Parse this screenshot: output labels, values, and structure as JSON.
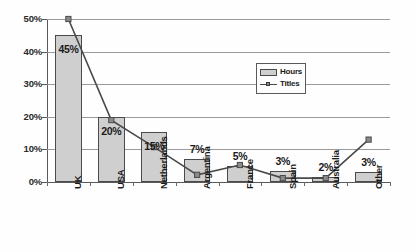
{
  "chart_data": {
    "type": "bar",
    "title": "",
    "subtitle": "",
    "xlabel": "",
    "ylabel": "",
    "ylim": [
      0,
      50
    ],
    "yticks": [
      "0%",
      "10%",
      "20%",
      "30%",
      "40%",
      "50%"
    ],
    "ytick_values": [
      0,
      10,
      20,
      30,
      40,
      50
    ],
    "grid": true,
    "legend_position": "inside upper-right",
    "categories": [
      "UK",
      "USA",
      "Netherlands",
      "Argentina",
      "France",
      "Spain",
      "Australia",
      "Other"
    ],
    "series": [
      {
        "name": "Hours",
        "chart_type": "bar",
        "values": [
          45,
          20,
          15.5,
          7,
          5,
          3.3,
          1.5,
          3
        ],
        "data_labels": [
          "45%",
          "20%",
          "15%",
          "7%",
          "5%",
          "3%",
          "2%",
          "3%"
        ]
      },
      {
        "name": "Titles",
        "chart_type": "line",
        "values": [
          50,
          19,
          10.7,
          2.2,
          5.2,
          1.2,
          1.2,
          13
        ],
        "data_labels": []
      }
    ],
    "colors": {
      "bar_fill": "#cfcfcf",
      "bar_border": "#4a4a4a",
      "line": "#4a4a4a",
      "marker_fill": "#8a8a8a",
      "gridline": "#9a9a9a",
      "axis": "#5a5a5a",
      "text": "#1a1a1a",
      "background": "#fefefe"
    }
  },
  "legend": {
    "entries": [
      {
        "label": "Hours",
        "marker": "bar-swatch-icon"
      },
      {
        "label": "Titles",
        "marker": "line-marker-icon"
      }
    ]
  }
}
